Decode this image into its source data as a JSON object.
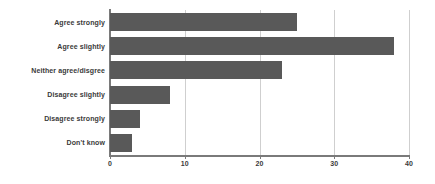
{
  "chart_data": {
    "type": "bar",
    "orientation": "horizontal",
    "title": "",
    "xlabel": "",
    "ylabel": "",
    "categories": [
      "Agree strongly",
      "Agree slightly",
      "Neither agree/disgree",
      "Disagree slightly",
      "Disagree strongly",
      "Don't know"
    ],
    "values": [
      25,
      38,
      23,
      8,
      4,
      3
    ],
    "xlim": [
      0,
      40
    ],
    "xticks": [
      0,
      10,
      20,
      30,
      40
    ],
    "xtick_labels": [
      "0",
      "10",
      "20",
      "30",
      "40"
    ],
    "grid": "vertical",
    "legend": "none",
    "bar_color": "#595959",
    "gridline_color": "#cfcfcf",
    "axis_color": "#7a7a7a",
    "label_color": "#3a3a3a"
  }
}
